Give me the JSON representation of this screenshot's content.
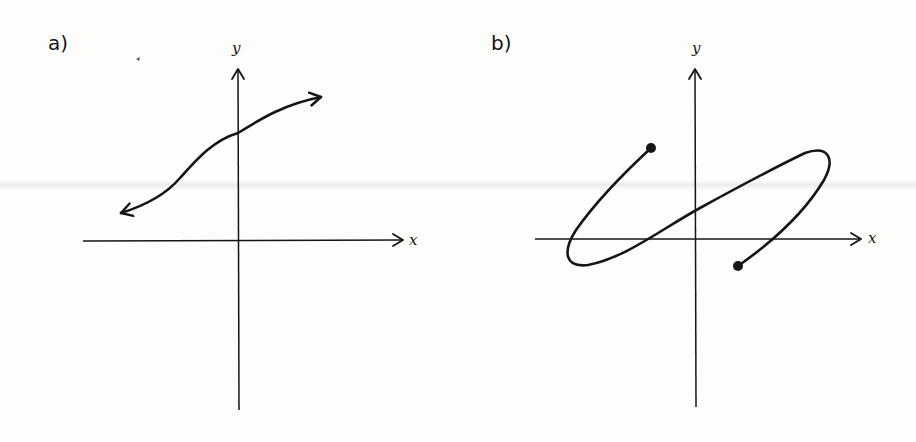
{
  "panels": [
    {
      "id": "a",
      "label": "a)",
      "x_axis_label": "x",
      "y_axis_label": "y",
      "curve": {
        "description": "Smooth increasing S-shaped curve with arrowheads at both ends (continues indefinitely)",
        "endpoints": "arrows",
        "start_px": [
          120,
          213
        ],
        "end_px": [
          322,
          97
        ]
      }
    },
    {
      "id": "b",
      "label": "b)",
      "x_axis_label": "x",
      "y_axis_label": "y",
      "curve": {
        "description": "Curve looping back on itself (sideways S / loop shape) with closed dots at both endpoints",
        "endpoints": "closed-dots",
        "start_px": [
          651,
          148
        ],
        "end_px": [
          738,
          266
        ]
      }
    }
  ],
  "colors": {
    "ink": "#151515",
    "background": "#fdfdfc"
  }
}
